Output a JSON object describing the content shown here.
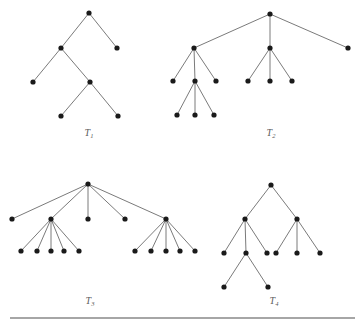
{
  "figure": {
    "title": "",
    "background_color": "#ffffff",
    "node_color": "#1a1a1a",
    "edge_color": "#6b6b6b",
    "label_color": "#5c5c5c",
    "node_radius": 2.6,
    "width": 361,
    "height": 324
  },
  "trees": [
    {
      "id": "T1",
      "label_base": "T",
      "label_sub": "1",
      "label_x": 89,
      "label_y": 136,
      "nodes": [
        {
          "id": "t1n0",
          "x": 89,
          "y": 13
        },
        {
          "id": "t1n1",
          "x": 61,
          "y": 48
        },
        {
          "id": "t1n2",
          "x": 117,
          "y": 48
        },
        {
          "id": "t1n3",
          "x": 33,
          "y": 82
        },
        {
          "id": "t1n4",
          "x": 90,
          "y": 82
        },
        {
          "id": "t1n5",
          "x": 61,
          "y": 116
        },
        {
          "id": "t1n6",
          "x": 118,
          "y": 116
        }
      ],
      "edges": [
        [
          "t1n0",
          "t1n1"
        ],
        [
          "t1n0",
          "t1n2"
        ],
        [
          "t1n1",
          "t1n3"
        ],
        [
          "t1n1",
          "t1n4"
        ],
        [
          "t1n4",
          "t1n5"
        ],
        [
          "t1n4",
          "t1n6"
        ]
      ]
    },
    {
      "id": "T2",
      "label_base": "T",
      "label_sub": "2",
      "label_x": 271,
      "label_y": 136,
      "nodes": [
        {
          "id": "t2n0",
          "x": 270,
          "y": 14
        },
        {
          "id": "t2n1",
          "x": 194,
          "y": 48
        },
        {
          "id": "t2n2",
          "x": 270,
          "y": 48
        },
        {
          "id": "t2n3",
          "x": 348,
          "y": 48
        },
        {
          "id": "t2n4",
          "x": 173,
          "y": 81
        },
        {
          "id": "t2n5",
          "x": 195,
          "y": 81
        },
        {
          "id": "t2n6",
          "x": 216,
          "y": 81
        },
        {
          "id": "t2n7",
          "x": 248,
          "y": 81
        },
        {
          "id": "t2n8",
          "x": 270,
          "y": 81
        },
        {
          "id": "t2n9",
          "x": 292,
          "y": 81
        },
        {
          "id": "t2n10",
          "x": 177,
          "y": 115
        },
        {
          "id": "t2n11",
          "x": 195,
          "y": 115
        },
        {
          "id": "t2n12",
          "x": 214,
          "y": 115
        }
      ],
      "edges": [
        [
          "t2n0",
          "t2n1"
        ],
        [
          "t2n0",
          "t2n2"
        ],
        [
          "t2n0",
          "t2n3"
        ],
        [
          "t2n1",
          "t2n4"
        ],
        [
          "t2n1",
          "t2n5"
        ],
        [
          "t2n1",
          "t2n6"
        ],
        [
          "t2n2",
          "t2n7"
        ],
        [
          "t2n2",
          "t2n8"
        ],
        [
          "t2n2",
          "t2n9"
        ],
        [
          "t2n5",
          "t2n10"
        ],
        [
          "t2n5",
          "t2n11"
        ],
        [
          "t2n5",
          "t2n12"
        ]
      ]
    },
    {
      "id": "T3",
      "label_base": "T",
      "label_sub": "3",
      "label_x": 90,
      "label_y": 304,
      "nodes": [
        {
          "id": "t3n0",
          "x": 88,
          "y": 184
        },
        {
          "id": "t3n1",
          "x": 12,
          "y": 219
        },
        {
          "id": "t3n2",
          "x": 51,
          "y": 219
        },
        {
          "id": "t3n3",
          "x": 88,
          "y": 219
        },
        {
          "id": "t3n4",
          "x": 125,
          "y": 219
        },
        {
          "id": "t3n5",
          "x": 166,
          "y": 219
        },
        {
          "id": "t3n6",
          "x": 21,
          "y": 251
        },
        {
          "id": "t3n7",
          "x": 37,
          "y": 251
        },
        {
          "id": "t3n8",
          "x": 51,
          "y": 251
        },
        {
          "id": "t3n9",
          "x": 64,
          "y": 251
        },
        {
          "id": "t3n10",
          "x": 79,
          "y": 251
        },
        {
          "id": "t3n11",
          "x": 135,
          "y": 251
        },
        {
          "id": "t3n12",
          "x": 151,
          "y": 251
        },
        {
          "id": "t3n13",
          "x": 166,
          "y": 251
        },
        {
          "id": "t3n14",
          "x": 180,
          "y": 251
        },
        {
          "id": "t3n15",
          "x": 195,
          "y": 251
        }
      ],
      "edges": [
        [
          "t3n0",
          "t3n1"
        ],
        [
          "t3n0",
          "t3n2"
        ],
        [
          "t3n0",
          "t3n3"
        ],
        [
          "t3n0",
          "t3n4"
        ],
        [
          "t3n0",
          "t3n5"
        ],
        [
          "t3n2",
          "t3n6"
        ],
        [
          "t3n2",
          "t3n7"
        ],
        [
          "t3n2",
          "t3n8"
        ],
        [
          "t3n2",
          "t3n9"
        ],
        [
          "t3n2",
          "t3n10"
        ],
        [
          "t3n5",
          "t3n11"
        ],
        [
          "t3n5",
          "t3n12"
        ],
        [
          "t3n5",
          "t3n13"
        ],
        [
          "t3n5",
          "t3n14"
        ],
        [
          "t3n5",
          "t3n15"
        ]
      ]
    },
    {
      "id": "T4",
      "label_base": "T",
      "label_sub": "4",
      "label_x": 274,
      "label_y": 304,
      "nodes": [
        {
          "id": "t4n0",
          "x": 271,
          "y": 185
        },
        {
          "id": "t4n1",
          "x": 245,
          "y": 219
        },
        {
          "id": "t4n2",
          "x": 297,
          "y": 219
        },
        {
          "id": "t4n3",
          "x": 224,
          "y": 253
        },
        {
          "id": "t4n4",
          "x": 246,
          "y": 253
        },
        {
          "id": "t4n5",
          "x": 267,
          "y": 253
        },
        {
          "id": "t4n6",
          "x": 276,
          "y": 253
        },
        {
          "id": "t4n7",
          "x": 297,
          "y": 253
        },
        {
          "id": "t4n8",
          "x": 320,
          "y": 253
        },
        {
          "id": "t4n9",
          "x": 224,
          "y": 287
        },
        {
          "id": "t4n10",
          "x": 268,
          "y": 287
        }
      ],
      "edges": [
        [
          "t4n0",
          "t4n1"
        ],
        [
          "t4n0",
          "t4n2"
        ],
        [
          "t4n1",
          "t4n3"
        ],
        [
          "t4n1",
          "t4n4"
        ],
        [
          "t4n1",
          "t4n5"
        ],
        [
          "t4n2",
          "t4n6"
        ],
        [
          "t4n2",
          "t4n7"
        ],
        [
          "t4n2",
          "t4n8"
        ],
        [
          "t4n4",
          "t4n9"
        ],
        [
          "t4n4",
          "t4n10"
        ]
      ]
    }
  ],
  "rule": {
    "x1": 10,
    "x2": 355,
    "y": 318,
    "color": "#4f4f4f"
  }
}
